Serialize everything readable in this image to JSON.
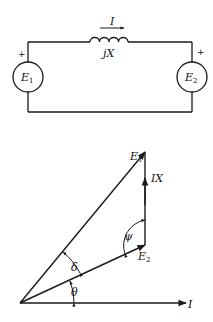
{
  "circuit": {
    "current_label": "I",
    "reactance_label": "jX",
    "source1": {
      "label": "E",
      "sub": "1",
      "polarity": "+"
    },
    "source2": {
      "label": "E",
      "sub": "2",
      "polarity": "+"
    }
  },
  "phasor": {
    "e1_label": "E",
    "e1_sub": "1",
    "ix_label": "IX",
    "e2_label": "E",
    "e2_sub": "2",
    "i_label": "I",
    "angle_psi": "ψ",
    "angle_delta": "δ",
    "angle_theta": "θ"
  },
  "colors": {
    "stroke": "#1a1a1a",
    "background": "#ffffff"
  }
}
